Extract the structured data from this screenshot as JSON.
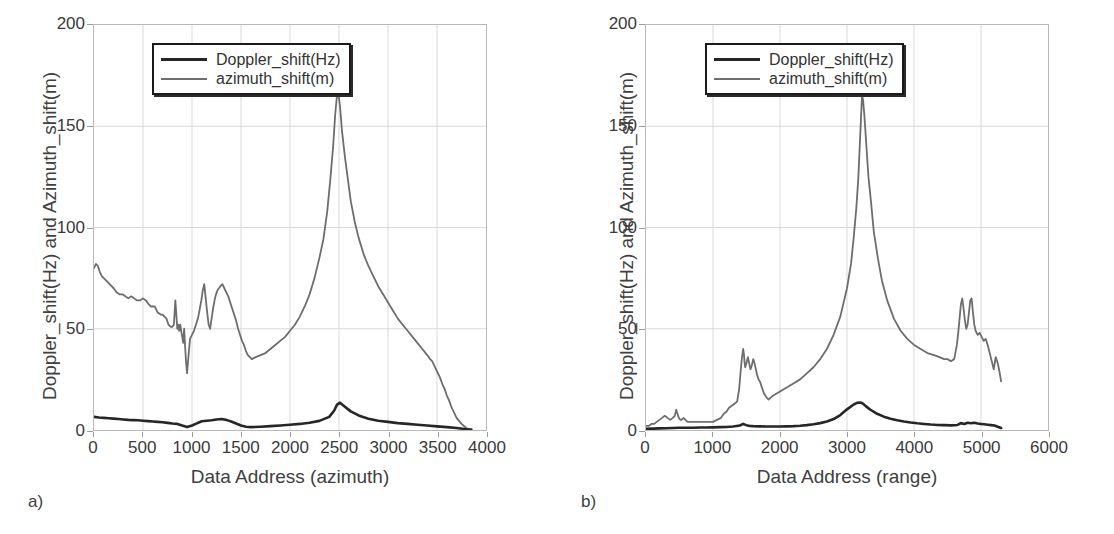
{
  "figure": {
    "background": "#ffffff",
    "series_colors": {
      "doppler": "#262626",
      "azimuth": "#6d6d6d"
    },
    "grid_color": "#d9d9d9",
    "frame_color": "#b9b9b9"
  },
  "panels": [
    {
      "caption": "a)",
      "xlabel": "Data Address (azimuth)",
      "ylabel": "Doppler_shift(Hz) and Azimuth_shift(m)",
      "legend": [
        {
          "label": "Doppler_shift(Hz)",
          "color": "#262626"
        },
        {
          "label": "azimuth_shift(m)",
          "color": "#6d6d6d"
        }
      ],
      "xticks": [
        "0",
        "500",
        "1000",
        "1500",
        "2000",
        "2500",
        "3000",
        "3500",
        "4000"
      ],
      "yticks": [
        "0",
        "50",
        "100",
        "150",
        "200"
      ]
    },
    {
      "caption": "b)",
      "xlabel": "Data Address (range)",
      "ylabel": "Doppler_shift(Hz) and Azimuth_shift(m)",
      "legend": [
        {
          "label": "Doppler_shift(Hz)",
          "color": "#262626"
        },
        {
          "label": "azimuth_shift(m)",
          "color": "#6d6d6d"
        }
      ],
      "xticks": [
        "0",
        "1000",
        "2000",
        "3000",
        "4000",
        "5000",
        "6000"
      ],
      "yticks": [
        "0",
        "50",
        "100",
        "150",
        "200"
      ]
    }
  ],
  "chart_data": [
    {
      "type": "line",
      "panel": "a",
      "title": "",
      "xlabel": "Data Address (azimuth)",
      "ylabel": "Doppler_shift(Hz) and Azimuth_shift(m)",
      "xlim": [
        0,
        4000
      ],
      "ylim": [
        0,
        200
      ],
      "xticks": [
        0,
        500,
        1000,
        1500,
        2000,
        2500,
        3000,
        3500,
        4000
      ],
      "yticks": [
        0,
        50,
        100,
        150,
        200
      ],
      "grid": true,
      "legend_position": "upper-center",
      "series": [
        {
          "name": "azimuth_shift(m)",
          "color": "#6d6d6d",
          "x": [
            0,
            20,
            40,
            60,
            80,
            100,
            120,
            140,
            160,
            180,
            200,
            230,
            260,
            290,
            320,
            350,
            380,
            410,
            440,
            470,
            500,
            530,
            560,
            580,
            600,
            620,
            650,
            680,
            700,
            720,
            740,
            760,
            780,
            800,
            815,
            830,
            840,
            850,
            860,
            870,
            880,
            890,
            900,
            910,
            920,
            930,
            940,
            950,
            965,
            980,
            1000,
            1020,
            1040,
            1060,
            1080,
            1095,
            1110,
            1125,
            1140,
            1155,
            1170,
            1185,
            1200,
            1215,
            1230,
            1245,
            1260,
            1275,
            1290,
            1310,
            1330,
            1350,
            1370,
            1390,
            1410,
            1430,
            1450,
            1470,
            1490,
            1510,
            1530,
            1550,
            1570,
            1590,
            1610,
            1650,
            1700,
            1750,
            1800,
            1850,
            1900,
            1950,
            2000,
            2050,
            2100,
            2150,
            2200,
            2250,
            2300,
            2340,
            2380,
            2410,
            2440,
            2460,
            2475,
            2485,
            2495,
            2510,
            2530,
            2560,
            2590,
            2620,
            2660,
            2700,
            2750,
            2800,
            2850,
            2900,
            2950,
            3000,
            3050,
            3100,
            3150,
            3200,
            3250,
            3300,
            3350,
            3400,
            3430,
            3450,
            3470,
            3500,
            3530,
            3560,
            3580,
            3600,
            3620,
            3650,
            3700,
            3750,
            3800,
            3850
          ],
          "y": [
            80,
            82,
            81,
            78,
            76,
            75,
            74,
            73,
            72,
            71,
            70,
            68,
            67,
            67,
            66,
            65,
            66,
            65,
            64,
            64,
            65,
            64,
            62,
            61,
            61,
            61,
            58,
            57,
            57,
            56,
            55,
            52,
            51,
            51,
            52,
            64,
            57,
            50,
            52,
            49,
            52,
            49,
            46,
            43,
            50,
            41,
            33,
            28,
            37,
            45,
            47,
            49,
            52,
            55,
            60,
            64,
            69,
            72,
            65,
            58,
            52,
            50,
            55,
            60,
            64,
            67,
            69,
            70,
            71,
            72,
            70,
            68,
            66,
            63,
            60,
            57,
            54,
            50,
            47,
            44,
            42,
            39,
            37,
            36,
            35,
            36,
            37,
            38,
            40,
            42,
            44,
            46,
            49,
            52,
            56,
            61,
            67,
            75,
            85,
            94,
            108,
            123,
            140,
            155,
            163,
            167,
            166,
            160,
            148,
            135,
            124,
            113,
            103,
            95,
            87,
            81,
            76,
            71,
            67,
            63,
            59,
            55,
            52,
            49,
            46,
            43,
            40,
            37,
            35,
            34,
            32,
            29,
            26,
            22,
            20,
            17,
            15,
            11,
            6,
            3,
            1,
            0
          ],
          "linewidth": 1.8
        },
        {
          "name": "Doppler_shift(Hz)",
          "color": "#262626",
          "x": [
            0,
            50,
            100,
            150,
            200,
            250,
            300,
            350,
            400,
            450,
            500,
            550,
            600,
            650,
            700,
            750,
            800,
            850,
            900,
            950,
            1000,
            1050,
            1100,
            1150,
            1200,
            1250,
            1300,
            1350,
            1400,
            1450,
            1500,
            1550,
            1600,
            1700,
            1800,
            1900,
            2000,
            2100,
            2200,
            2300,
            2400,
            2450,
            2480,
            2510,
            2560,
            2620,
            2700,
            2800,
            2900,
            3000,
            3100,
            3200,
            3300,
            3400,
            3500,
            3600,
            3700,
            3800,
            3850
          ],
          "y": [
            6.5,
            6.2,
            6.0,
            5.8,
            5.6,
            5.4,
            5.2,
            5.0,
            4.9,
            4.8,
            4.6,
            4.4,
            4.2,
            4.0,
            3.8,
            3.5,
            3.2,
            3.0,
            2.2,
            1.5,
            2.2,
            3.3,
            4.3,
            4.6,
            4.8,
            5.2,
            5.4,
            5.0,
            4.2,
            3.2,
            2.2,
            1.6,
            1.4,
            1.6,
            1.9,
            2.2,
            2.6,
            3.0,
            3.6,
            4.5,
            6.5,
            9.5,
            12.5,
            13.5,
            11.5,
            9.2,
            7.2,
            5.6,
            4.6,
            4.0,
            3.4,
            3.0,
            2.6,
            2.2,
            1.8,
            1.4,
            1.0,
            0.4,
            0.2
          ],
          "linewidth": 2.6
        }
      ]
    },
    {
      "type": "line",
      "panel": "b",
      "title": "",
      "xlabel": "Data Address (range)",
      "ylabel": "Doppler_shift(Hz) and Azimuth_shift(m)",
      "xlim": [
        0,
        6000
      ],
      "ylim": [
        0,
        200
      ],
      "xticks": [
        0,
        1000,
        2000,
        3000,
        4000,
        5000,
        6000
      ],
      "yticks": [
        0,
        50,
        100,
        150,
        200
      ],
      "grid": true,
      "legend_position": "upper-center",
      "series": [
        {
          "name": "azimuth_shift(m)",
          "color": "#6d6d6d",
          "x": [
            0,
            40,
            80,
            120,
            160,
            200,
            240,
            280,
            320,
            360,
            400,
            430,
            450,
            470,
            490,
            510,
            530,
            560,
            590,
            620,
            660,
            700,
            760,
            820,
            880,
            940,
            1000,
            1060,
            1120,
            1160,
            1200,
            1240,
            1280,
            1320,
            1360,
            1390,
            1410,
            1430,
            1450,
            1460,
            1470,
            1480,
            1500,
            1520,
            1540,
            1560,
            1580,
            1600,
            1620,
            1640,
            1660,
            1680,
            1700,
            1720,
            1740,
            1760,
            1780,
            1800,
            1830,
            1860,
            1900,
            1950,
            2000,
            2100,
            2200,
            2300,
            2400,
            2500,
            2600,
            2700,
            2800,
            2900,
            3000,
            3060,
            3100,
            3140,
            3170,
            3190,
            3210,
            3225,
            3240,
            3260,
            3290,
            3320,
            3360,
            3400,
            3460,
            3520,
            3600,
            3700,
            3800,
            3900,
            4000,
            4100,
            4200,
            4300,
            4380,
            4450,
            4500,
            4550,
            4600,
            4640,
            4660,
            4680,
            4700,
            4720,
            4740,
            4760,
            4780,
            4800,
            4820,
            4840,
            4860,
            4880,
            4900,
            4920,
            4950,
            4980,
            5010,
            5040,
            5070,
            5100,
            5130,
            5160,
            5190,
            5220,
            5250,
            5280,
            5300
          ],
          "y": [
            2,
            2,
            3,
            3,
            4,
            5,
            6,
            7,
            6,
            5,
            6,
            7,
            10,
            8,
            6,
            5,
            5,
            6,
            5,
            4,
            4,
            4,
            4,
            4,
            4,
            4,
            4,
            5,
            6,
            8,
            9,
            11,
            12,
            13,
            14,
            20,
            28,
            35,
            40,
            38,
            34,
            31,
            33,
            36,
            33,
            30,
            32,
            35,
            33,
            30,
            27,
            25,
            24,
            22,
            20,
            18,
            17,
            16,
            15,
            16,
            17,
            18,
            19,
            21,
            23,
            25,
            28,
            31,
            35,
            40,
            47,
            56,
            70,
            82,
            95,
            110,
            125,
            140,
            155,
            165,
            163,
            155,
            140,
            125,
            112,
            98,
            85,
            74,
            64,
            55,
            49,
            45,
            42,
            40,
            38,
            37,
            36,
            35,
            35,
            34,
            35,
            42,
            48,
            55,
            62,
            65,
            60,
            54,
            50,
            52,
            58,
            64,
            65,
            58,
            52,
            49,
            47,
            48,
            46,
            44,
            45,
            42,
            38,
            34,
            30,
            36,
            33,
            28,
            24,
            22
          ],
          "linewidth": 1.8
        },
        {
          "name": "Doppler_shift(Hz)",
          "color": "#262626",
          "x": [
            0,
            100,
            200,
            300,
            400,
            500,
            600,
            700,
            800,
            900,
            1000,
            1100,
            1200,
            1300,
            1400,
            1450,
            1500,
            1550,
            1600,
            1700,
            1800,
            1900,
            2000,
            2100,
            2200,
            2300,
            2400,
            2500,
            2600,
            2700,
            2800,
            2900,
            3000,
            3100,
            3150,
            3200,
            3240,
            3280,
            3350,
            3450,
            3550,
            3650,
            3750,
            3850,
            3950,
            4050,
            4150,
            4250,
            4350,
            4450,
            4550,
            4650,
            4700,
            4750,
            4800,
            4850,
            4900,
            4950,
            5000,
            5050,
            5100,
            5150,
            5200,
            5250,
            5300
          ],
          "y": [
            0.6,
            0.7,
            0.8,
            0.9,
            1.0,
            1.1,
            1.1,
            1.1,
            1.2,
            1.2,
            1.3,
            1.4,
            1.5,
            1.7,
            2.2,
            3.0,
            2.4,
            2.0,
            1.9,
            1.8,
            1.7,
            1.7,
            1.7,
            1.8,
            1.9,
            2.1,
            2.4,
            2.8,
            3.4,
            4.2,
            5.4,
            7.4,
            10.2,
            12.6,
            13.4,
            13.6,
            13.0,
            11.8,
            10.0,
            8.0,
            6.6,
            5.6,
            4.8,
            4.2,
            3.7,
            3.3,
            3.0,
            2.7,
            2.5,
            2.4,
            2.3,
            2.5,
            3.4,
            3.0,
            3.6,
            3.3,
            3.6,
            3.2,
            3.0,
            2.8,
            2.6,
            2.4,
            2.2,
            1.6,
            1.0
          ],
          "linewidth": 2.6
        }
      ]
    }
  ]
}
